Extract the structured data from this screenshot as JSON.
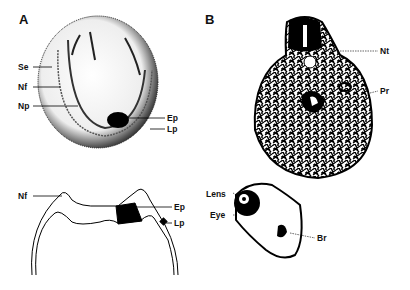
{
  "figure": {
    "panel_a": {
      "letter": "A",
      "top_view_labels": [
        "Se",
        "Nf",
        "Np",
        "Ep",
        "Lp"
      ],
      "section_labels": [
        "Nf",
        "Ep",
        "Lp"
      ]
    },
    "panel_b": {
      "letter": "B",
      "labels": [
        "Nt",
        "Pr",
        "Lens",
        "Eye",
        "Br"
      ]
    }
  }
}
